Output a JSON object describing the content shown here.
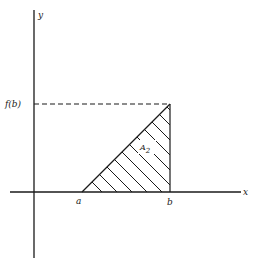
{
  "diagram": {
    "axes": {
      "x_label": "x",
      "y_label": "y"
    },
    "points": {
      "a_label": "a",
      "b_label": "b",
      "fb_label": "f(b)"
    },
    "region": {
      "label_main": "A",
      "label_sub": "2",
      "shading": "diagonal hatch"
    },
    "colors": {
      "ink": "#1a1a1a",
      "background": "#ffffff"
    }
  }
}
